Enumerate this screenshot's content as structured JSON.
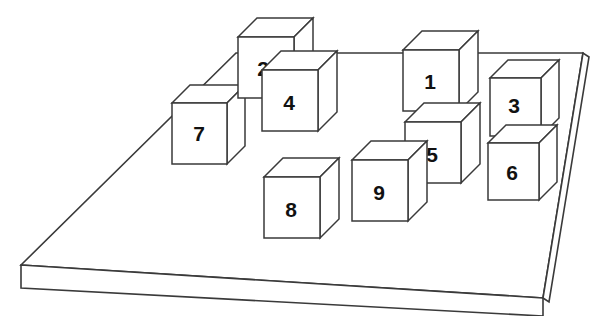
{
  "scene": {
    "title": "Numbered cubes on a rectangular platform",
    "type": "isometric-block-scene",
    "canvas": {
      "width": 605,
      "height": 316
    },
    "background_color": "#ffffff",
    "line_color": "#3a3a3a",
    "face_color": "#ffffff",
    "label_color": "#111111",
    "cube_count": 9
  },
  "platform": {
    "name": "platform",
    "top_face_points": "21,265 236,53 583,53 543,298",
    "front_face_points": "21,265 543,298 543,316 21,288",
    "right_face_points": "543,298 583,53 589,57 549,302",
    "thickness_px": 22
  },
  "cubes": [
    {
      "id": "cube-7",
      "label": "7",
      "front": "172,103 172,164 227,164 227,103",
      "top": "172,103 190,85 245,85 227,103",
      "side": "227,103 245,85 245,146 227,164",
      "label_x": 199,
      "label_y": 135
    },
    {
      "id": "cube-2",
      "label": "2",
      "front": "238,37 238,98 294,98 294,37",
      "top": "238,37 257,18 313,18 294,37",
      "side": "294,37 313,18 313,79 294,98",
      "label_x": 263,
      "label_y": 70
    },
    {
      "id": "cube-4",
      "label": "4",
      "front": "262,70 262,131 318,131 318,70",
      "top": "262,70 281,51 337,51 318,70",
      "side": "318,70 337,51 337,112 318,131",
      "label_x": 289,
      "label_y": 104
    },
    {
      "id": "cube-8",
      "label": "8",
      "front": "264,177 264,238 320,238 320,177",
      "top": "264,177 283,158 339,158 320,177",
      "side": "320,177 339,158 339,219 320,238",
      "label_x": 291,
      "label_y": 211
    },
    {
      "id": "cube-9",
      "label": "9",
      "front": "352,160 352,221 408,221 408,160",
      "top": "352,160 371,141 427,141 408,160",
      "side": "408,160 427,141 427,202 408,221",
      "label_x": 379,
      "label_y": 194
    },
    {
      "id": "cube-1",
      "label": "1",
      "front": "403,50 403,111 459,111 459,50",
      "top": "403,50 422,31 478,31 459,50",
      "side": "459,50 478,31 478,92 459,111",
      "label_x": 430,
      "label_y": 83
    },
    {
      "id": "cube-5",
      "label": "5",
      "front": "405,122 405,183 461,183 461,122",
      "top": "405,122 424,103 480,103 461,122",
      "side": "461,122 480,103 480,164 461,183",
      "label_x": 432,
      "label_y": 156
    },
    {
      "id": "cube-3",
      "label": "3",
      "front": "490,78 490,136 541,136 541,78",
      "top": "490,78 508,60 559,60 541,78",
      "side": "541,78 559,60 559,118 541,136",
      "label_x": 514,
      "label_y": 107
    },
    {
      "id": "cube-6",
      "label": "6",
      "front": "488,143 488,200 539,200 539,143",
      "top": "488,143 506,125 557,125 539,143",
      "side": "539,143 557,125 557,182 539,200",
      "label_x": 512,
      "label_y": 174
    }
  ]
}
